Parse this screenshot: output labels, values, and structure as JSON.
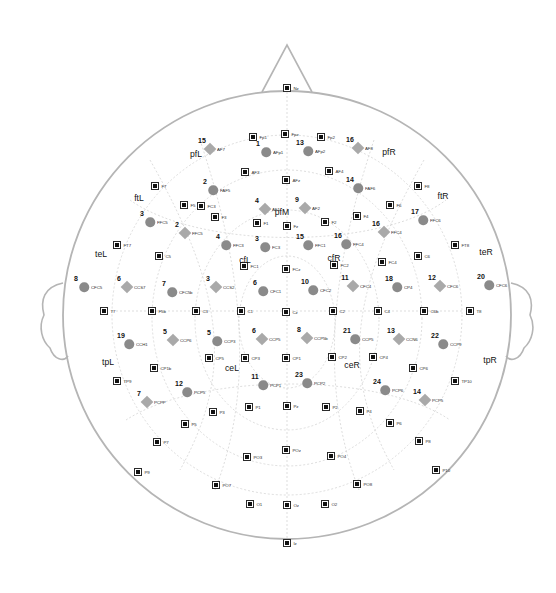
{
  "figure": {
    "type": "eeg-electrode-montage",
    "title": "",
    "head_outline_color": "#b5b5b5",
    "electrode_color": "#111111",
    "circle_marker_color": "#8a8a8a",
    "diamond_marker_color": "#a9a9a9",
    "grid_color": "#c9c9c9"
  },
  "anatomy": {
    "nose": "nose-triangle",
    "left_ear": "left-ear",
    "right_ear": "right-ear",
    "head": "head-circle"
  },
  "regions": [
    {
      "label": "pfL",
      "x": 196,
      "y": 154
    },
    {
      "label": "pfR",
      "x": 389,
      "y": 152
    },
    {
      "label": "pfM",
      "x": 282,
      "y": 212
    },
    {
      "label": "ftL",
      "x": 139,
      "y": 198
    },
    {
      "label": "ftR",
      "x": 443,
      "y": 196
    },
    {
      "label": "teL",
      "x": 101,
      "y": 254
    },
    {
      "label": "teR",
      "x": 486,
      "y": 252
    },
    {
      "label": "cfL",
      "x": 245,
      "y": 260
    },
    {
      "label": "cfR",
      "x": 334,
      "y": 258
    },
    {
      "label": "ceL",
      "x": 232,
      "y": 368
    },
    {
      "label": "ceR",
      "x": 352,
      "y": 365
    },
    {
      "label": "tpL",
      "x": 108,
      "y": 362
    },
    {
      "label": "tpR",
      "x": 490,
      "y": 360
    }
  ],
  "electrodes": [
    {
      "label": "Fp1",
      "x": 253,
      "y": 137
    },
    {
      "label": "Fpz",
      "x": 285,
      "y": 134
    },
    {
      "label": "Fp2",
      "x": 321,
      "y": 137
    },
    {
      "label": "AF3",
      "x": 245,
      "y": 172
    },
    {
      "label": "AFz",
      "x": 286,
      "y": 180
    },
    {
      "label": "AF4",
      "x": 329,
      "y": 171
    },
    {
      "label": "F7",
      "x": 155,
      "y": 186
    },
    {
      "label": "F5",
      "x": 184,
      "y": 205
    },
    {
      "label": "F3",
      "x": 215,
      "y": 217
    },
    {
      "label": "F1",
      "x": 257,
      "y": 223
    },
    {
      "label": "Fz",
      "x": 287,
      "y": 226
    },
    {
      "label": "F2",
      "x": 325,
      "y": 222
    },
    {
      "label": "F4",
      "x": 357,
      "y": 216
    },
    {
      "label": "F6",
      "x": 390,
      "y": 205
    },
    {
      "label": "F8",
      "x": 418,
      "y": 186
    },
    {
      "label": "FT7",
      "x": 117,
      "y": 245
    },
    {
      "label": "C5",
      "x": 159,
      "y": 256
    },
    {
      "label": "FC3",
      "x": 201,
      "y": 206
    },
    {
      "label": "FC1",
      "x": 244,
      "y": 266
    },
    {
      "label": "FCz",
      "x": 286,
      "y": 269
    },
    {
      "label": "FC2",
      "x": 334,
      "y": 265
    },
    {
      "label": "FC4",
      "x": 382,
      "y": 262
    },
    {
      "label": "FT8",
      "x": 455,
      "y": 245
    },
    {
      "label": "C6",
      "x": 418,
      "y": 256
    },
    {
      "label": "T7",
      "x": 104,
      "y": 311
    },
    {
      "label": "F5b",
      "x": 152,
      "y": 311
    },
    {
      "label": "C3",
      "x": 196,
      "y": 311
    },
    {
      "label": "C1",
      "x": 241,
      "y": 311
    },
    {
      "label": "Cz",
      "x": 286,
      "y": 312
    },
    {
      "label": "C2",
      "x": 333,
      "y": 311
    },
    {
      "label": "C4",
      "x": 378,
      "y": 311
    },
    {
      "label": "C6b",
      "x": 424,
      "y": 311
    },
    {
      "label": "T8",
      "x": 470,
      "y": 311
    },
    {
      "label": "CP5",
      "x": 209,
      "y": 358
    },
    {
      "label": "CP3",
      "x": 245,
      "y": 358
    },
    {
      "label": "CP1",
      "x": 286,
      "y": 358
    },
    {
      "label": "CP2",
      "x": 332,
      "y": 357
    },
    {
      "label": "CP4",
      "x": 373,
      "y": 357
    },
    {
      "label": "CP6",
      "x": 413,
      "y": 368
    },
    {
      "label": "CP1b",
      "x": 154,
      "y": 368
    },
    {
      "label": "TP9",
      "x": 117,
      "y": 381
    },
    {
      "label": "TP10",
      "x": 455,
      "y": 381
    },
    {
      "label": "P3",
      "x": 213,
      "y": 412
    },
    {
      "label": "P1",
      "x": 249,
      "y": 407
    },
    {
      "label": "Pz",
      "x": 287,
      "y": 406
    },
    {
      "label": "P2",
      "x": 326,
      "y": 407
    },
    {
      "label": "P4",
      "x": 360,
      "y": 411
    },
    {
      "label": "P5",
      "x": 185,
      "y": 424
    },
    {
      "label": "P6",
      "x": 390,
      "y": 423
    },
    {
      "label": "P7",
      "x": 157,
      "y": 442
    },
    {
      "label": "P8",
      "x": 419,
      "y": 441
    },
    {
      "label": "P9",
      "x": 138,
      "y": 472
    },
    {
      "label": "P10",
      "x": 436,
      "y": 470
    },
    {
      "label": "POz",
      "x": 286,
      "y": 450
    },
    {
      "label": "PO3",
      "x": 247,
      "y": 457
    },
    {
      "label": "PO4",
      "x": 331,
      "y": 456
    },
    {
      "label": "PO7",
      "x": 216,
      "y": 485
    },
    {
      "label": "PO8",
      "x": 357,
      "y": 484
    },
    {
      "label": "O1",
      "x": 250,
      "y": 504
    },
    {
      "label": "Oz",
      "x": 287,
      "y": 505
    },
    {
      "label": "O2",
      "x": 325,
      "y": 504
    },
    {
      "label": "Iz",
      "x": 287,
      "y": 543
    },
    {
      "label": "Nz",
      "x": 287,
      "y": 88
    }
  ],
  "circles": [
    {
      "n": "1",
      "label": "AFp1",
      "x": 266,
      "y": 152
    },
    {
      "n": "13",
      "label": "AFp2",
      "x": 308,
      "y": 151
    },
    {
      "n": "2",
      "label": "FAF5",
      "x": 213,
      "y": 190
    },
    {
      "n": "14",
      "label": "FAF6",
      "x": 358,
      "y": 188
    },
    {
      "n": "3",
      "label": "FFC5",
      "x": 150,
      "y": 222
    },
    {
      "n": "17",
      "label": "FFC6",
      "x": 423,
      "y": 220
    },
    {
      "n": "4",
      "label": "FFC3",
      "x": 226,
      "y": 245
    },
    {
      "n": "3b",
      "label": "FC3",
      "x": 265,
      "y": 247
    },
    {
      "n": "15",
      "label": "FFC1",
      "x": 308,
      "y": 245
    },
    {
      "n": "16",
      "label": "FFC4",
      "x": 346,
      "y": 244
    },
    {
      "n": "8",
      "label": "CFC5",
      "x": 84,
      "y": 287
    },
    {
      "n": "20",
      "label": "CFC6",
      "x": 489,
      "y": 285
    },
    {
      "n": "7",
      "label": "CFC5b",
      "x": 172,
      "y": 292
    },
    {
      "n": "6",
      "label": "CFC1",
      "x": 263,
      "y": 291
    },
    {
      "n": "10",
      "label": "CFC2",
      "x": 313,
      "y": 290
    },
    {
      "n": "19",
      "label": "CCH1",
      "x": 129,
      "y": 344
    },
    {
      "n": "5",
      "label": "CCP3",
      "x": 217,
      "y": 341
    },
    {
      "n": "21",
      "label": "CCP5",
      "x": 355,
      "y": 339
    },
    {
      "n": "22",
      "label": "CCP9",
      "x": 443,
      "y": 344
    },
    {
      "n": "11",
      "label": "PCP1",
      "x": 263,
      "y": 385
    },
    {
      "n": "23",
      "label": "PCP2",
      "x": 307,
      "y": 383
    },
    {
      "n": "12",
      "label": "PCP5",
      "x": 187,
      "y": 392
    },
    {
      "n": "24",
      "label": "PCP6",
      "x": 385,
      "y": 390
    },
    {
      "n": "18",
      "label": "CP4",
      "x": 397,
      "y": 287
    }
  ],
  "diamonds": [
    {
      "n": "15",
      "label": "AF7",
      "x": 210,
      "y": 149
    },
    {
      "n": "16",
      "label": "AF8",
      "x": 358,
      "y": 148
    },
    {
      "n": "4",
      "label": "AF1",
      "x": 265,
      "y": 209
    },
    {
      "n": "9",
      "label": "AF2",
      "x": 305,
      "y": 208
    },
    {
      "n": "2",
      "label": "FFC5",
      "x": 185,
      "y": 233
    },
    {
      "n": "16b",
      "label": "FFC4",
      "x": 384,
      "y": 232
    },
    {
      "n": "6",
      "label": "CCS7",
      "x": 127,
      "y": 287
    },
    {
      "n": "3",
      "label": "CCS2",
      "x": 216,
      "y": 287
    },
    {
      "n": "11",
      "label": "CFC4",
      "x": 353,
      "y": 286
    },
    {
      "n": "12",
      "label": "CFC6",
      "x": 440,
      "y": 286
    },
    {
      "n": "5",
      "label": "CCP6",
      "x": 173,
      "y": 340
    },
    {
      "n": "6b",
      "label": "CCP5",
      "x": 262,
      "y": 339
    },
    {
      "n": "8",
      "label": "CCP5b",
      "x": 307,
      "y": 338
    },
    {
      "n": "13",
      "label": "CCN6",
      "x": 399,
      "y": 339
    },
    {
      "n": "7",
      "label": "PCPP",
      "x": 147,
      "y": 402
    },
    {
      "n": "14",
      "label": "PCP5",
      "x": 425,
      "y": 400
    }
  ]
}
